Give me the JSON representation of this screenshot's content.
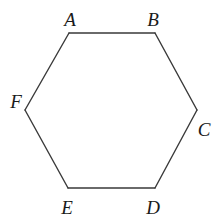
{
  "figure": {
    "shape": "regular hexagon",
    "vertices": [
      {
        "name": "A"
      },
      {
        "name": "B"
      },
      {
        "name": "C"
      },
      {
        "name": "D"
      },
      {
        "name": "E"
      },
      {
        "name": "F"
      }
    ],
    "edges": [
      [
        "A",
        "B"
      ],
      [
        "B",
        "C"
      ],
      [
        "C",
        "D"
      ],
      [
        "D",
        "E"
      ],
      [
        "E",
        "F"
      ],
      [
        "F",
        "A"
      ]
    ]
  }
}
